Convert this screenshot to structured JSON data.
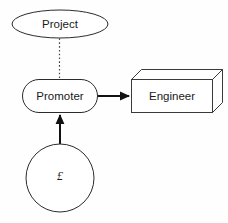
{
  "diagram": {
    "canvas": {
      "width": 228,
      "height": 223,
      "background": "#fefefe"
    },
    "colors": {
      "shape_stroke": "#2b2b2b",
      "shape_fill": "#ffffff",
      "edge_solid": "#111111",
      "edge_dotted": "#4a4a4a",
      "text": "#1a1a1a"
    },
    "nodes": [
      {
        "id": "project",
        "label": "Project",
        "shape": "ellipse",
        "cx": 60,
        "cy": 24,
        "rx": 48,
        "ry": 14
      },
      {
        "id": "promoter",
        "label": "Promoter",
        "shape": "rounded-rectangle",
        "x": 22,
        "y": 79,
        "width": 75,
        "height": 34,
        "rx": 17
      },
      {
        "id": "engineer",
        "label": "Engineer",
        "shape": "cube-3d",
        "x": 131,
        "y": 79,
        "width": 81,
        "height": 33,
        "depth": 10
      },
      {
        "id": "money",
        "label": "£",
        "shape": "circle",
        "cx": 60,
        "cy": 178,
        "r": 34
      }
    ],
    "edges": [
      {
        "id": "project-promoter",
        "from": "project",
        "to": "promoter",
        "style": "dotted",
        "arrowhead": "none",
        "label": ""
      },
      {
        "id": "promoter-engineer",
        "from": "promoter",
        "to": "engineer",
        "style": "solid",
        "arrowhead": "filled-triangle",
        "label": ""
      },
      {
        "id": "money-promoter",
        "from": "money",
        "to": "promoter",
        "style": "solid",
        "arrowhead": "filled-triangle",
        "label": ""
      }
    ]
  }
}
